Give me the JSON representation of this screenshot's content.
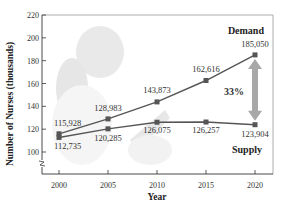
{
  "chart_data": {
    "type": "line",
    "title": "",
    "xlabel": "Year",
    "ylabel": "Number of Nurses (thousands)",
    "x": [
      2000,
      2005,
      2010,
      2015,
      2020
    ],
    "x_tick_labels": [
      "2000",
      "2005",
      "2010",
      "2015",
      "2020"
    ],
    "y_ticks": [
      100,
      120,
      140,
      160,
      180,
      200,
      220
    ],
    "y_tick_labels": [
      "100",
      "120",
      "140",
      "160",
      "180",
      "200",
      "220"
    ],
    "ylim": [
      85,
      220
    ],
    "y_axis_break": true,
    "grid": false,
    "series": [
      {
        "name": "Demand",
        "values": [
          115928,
          128983,
          143873,
          162616,
          185050
        ],
        "labels": [
          "115,928",
          "128,983",
          "143,873",
          "162,616",
          "185,050"
        ],
        "color": "#555555"
      },
      {
        "name": "Supply",
        "values": [
          112735,
          120285,
          126075,
          126257,
          123904
        ],
        "labels": [
          "112,735",
          "120,285",
          "126,075",
          "126,257",
          "123,904"
        ],
        "color": "#555555"
      }
    ],
    "annotations": [
      {
        "text": "33%",
        "type": "double-arrow-gap",
        "x": 2020,
        "from": 123904,
        "to": 185050,
        "color": "#a8a8a8"
      }
    ],
    "background_image": "faded photo of a nurse"
  }
}
